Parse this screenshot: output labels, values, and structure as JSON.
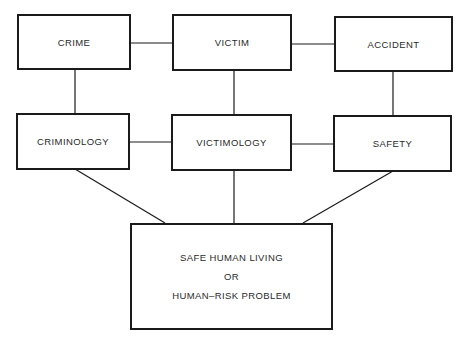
{
  "diagram": {
    "top_row": [
      {
        "id": "crime",
        "label": "CRIME"
      },
      {
        "id": "victim",
        "label": "VICTIM"
      },
      {
        "id": "accident",
        "label": "ACCIDENT"
      }
    ],
    "middle_row": [
      {
        "id": "criminology",
        "label": "CRIMINOLOGY"
      },
      {
        "id": "victimology",
        "label": "VICTIMOLOGY"
      },
      {
        "id": "safety",
        "label": "SAFETY"
      }
    ],
    "bottom": {
      "id": "outcome",
      "lines": [
        "SAFE HUMAN LIVING",
        "OR",
        "HUMAN–RISK PROBLEM"
      ]
    },
    "edges": [
      [
        "crime",
        "victim"
      ],
      [
        "victim",
        "accident"
      ],
      [
        "crime",
        "criminology"
      ],
      [
        "victim",
        "victimology"
      ],
      [
        "accident",
        "safety"
      ],
      [
        "criminology",
        "victimology"
      ],
      [
        "victimology",
        "safety"
      ],
      [
        "criminology",
        "outcome"
      ],
      [
        "victimology",
        "outcome"
      ],
      [
        "safety",
        "outcome"
      ]
    ],
    "colors": {
      "line": "#1a1a1a",
      "text": "#2a2a2a",
      "background": "#ffffff"
    }
  }
}
